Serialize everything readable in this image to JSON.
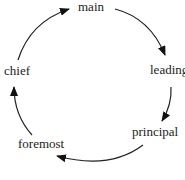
{
  "diagram": {
    "type": "cycle",
    "nodes": [
      {
        "id": "main",
        "label": "main"
      },
      {
        "id": "leading",
        "label": "leading"
      },
      {
        "id": "principal",
        "label": "principal"
      },
      {
        "id": "foremost",
        "label": "foremost"
      },
      {
        "id": "chief",
        "label": "chief"
      }
    ],
    "edges": [
      {
        "from": "main",
        "to": "leading"
      },
      {
        "from": "leading",
        "to": "principal"
      },
      {
        "from": "principal",
        "to": "foremost"
      },
      {
        "from": "foremost",
        "to": "chief"
      },
      {
        "from": "chief",
        "to": "main"
      }
    ]
  }
}
